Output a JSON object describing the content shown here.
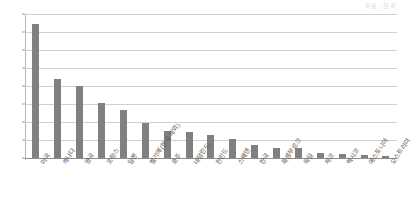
{
  "corner_note": "자료 : 한국",
  "chart_data": {
    "type": "bar",
    "title": "",
    "subtitle": "",
    "xlabel": "",
    "ylabel": "",
    "ylim": [
      0,
      1.6
    ],
    "ytick_step": 0.2,
    "decimal_separator": ",",
    "grid": true,
    "legend": "none",
    "bar_color": "#808080",
    "gridline_color": "#d0d0d0",
    "axis_color": "#8d8d8d",
    "label_rotation_deg": -55,
    "ytick_labels": [
      "1,6",
      "1,4",
      "1,2",
      "1",
      "0,8",
      "0,6",
      "0,4",
      "0,2",
      "0"
    ],
    "ytick_values": [
      1.6,
      1.4,
      1.2,
      1.0,
      0.8,
      0.6,
      0.4,
      0.2,
      0.0
    ],
    "categories": [
      "미국",
      "캐나다",
      "영국",
      "프랑스",
      "일본",
      "벨기에(한국 제외)",
      "호주",
      "네덜란드",
      "핀란드",
      "스웨덴",
      "한국",
      "룩셈부르크",
      "독일",
      "체코",
      "멕시코",
      "에스토니아",
      "오스트리아"
    ],
    "values": [
      1.49,
      0.88,
      0.8,
      0.61,
      0.53,
      0.39,
      0.3,
      0.285,
      0.26,
      0.215,
      0.15,
      0.115,
      0.11,
      0.06,
      0.045,
      0.03,
      0.025
    ]
  }
}
